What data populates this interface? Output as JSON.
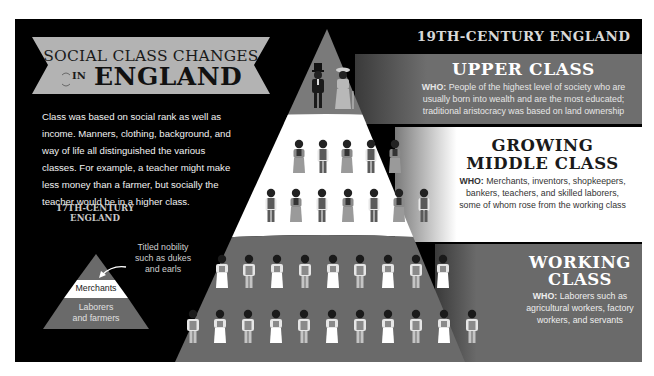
{
  "banner": {
    "line1": "SOCIAL CLASS CHANGES",
    "in": "IN",
    "line2": "ENGLAND"
  },
  "intro": {
    "text": "Class was based on social rank as well as income. Manners, clothing, background, and way of life all distinguished the various classes. For example, a teacher might make less money than a farmer, but socially the teacher would be in a higher class."
  },
  "century17": {
    "title_line1": "17TH-CENTURY",
    "title_line2": "ENGLAND",
    "tiers": [
      {
        "label": "Titled nobility such as dukes and earls",
        "lines": [
          "Titled nobility",
          "such as dukes",
          "and earls"
        ]
      },
      {
        "label": "Merchants"
      },
      {
        "label": "Laborers and farmers",
        "lines": [
          "Laborers",
          "and farmers"
        ]
      }
    ]
  },
  "century19": {
    "header": "19TH-CENTURY ENGLAND",
    "classes": [
      {
        "title": "UPPER CLASS",
        "who_label": "WHO:",
        "who_text": "People of the highest level of society who are usually born into wealth and are the most educated; traditional aristocracy was based on land ownership",
        "figure_count": 2
      },
      {
        "title_line1": "GROWING",
        "title_line2": "MIDDLE CLASS",
        "who_label": "WHO:",
        "who_text": "Merchants, inventors, shopkeepers, bankers, teachers, and skilled laborers, some of whom rose from the working class",
        "figure_rows": [
          5,
          7
        ]
      },
      {
        "title_line1": "WORKING",
        "title_line2": "CLASS",
        "who_label": "WHO:",
        "who_text": "Laborers such as agricultural workers, factory workers, and servants",
        "figure_rows": [
          9,
          11
        ]
      }
    ]
  },
  "colors": {
    "background": "#000000",
    "banner_gray": "#b3b3b3",
    "upper_band": "#6e6e6e",
    "middle_band": "#ffffff",
    "working_band": "#6a6a6a",
    "pyramid_top": "#7a7a7a",
    "header_text": "#d8d8d8"
  }
}
